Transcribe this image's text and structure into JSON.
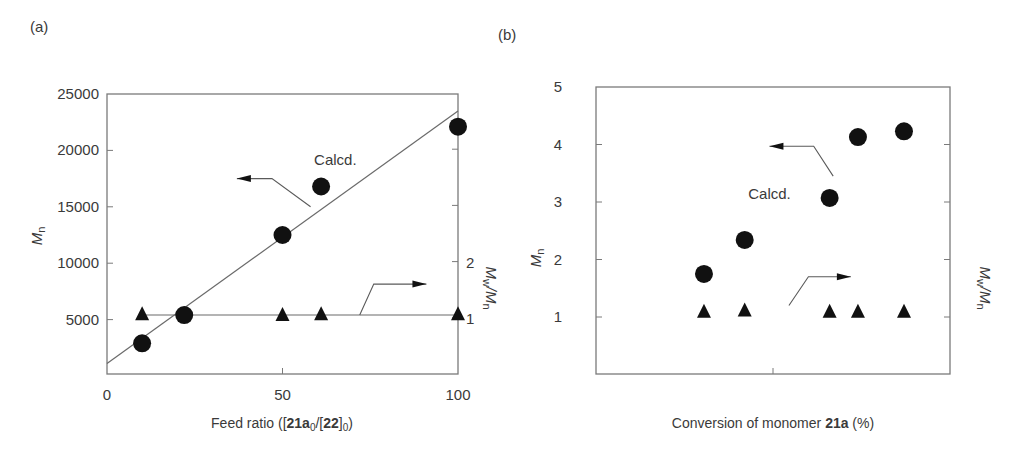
{
  "chart_data": [
    {
      "panel_label": "(a)",
      "type": "scatter",
      "title": "",
      "xlabel_parts": [
        {
          "text": "Feed ratio ([",
          "bold": false
        },
        {
          "text": "21a",
          "bold": true
        },
        {
          "text": "0",
          "bold": false,
          "sub": true
        },
        {
          "text": "/[",
          "bold": false
        },
        {
          "text": "22",
          "bold": true
        },
        {
          "text": "]",
          "bold": false
        },
        {
          "text": "0",
          "bold": false,
          "sub": true
        },
        {
          "text": ")",
          "bold": false
        }
      ],
      "ylabel_main": "M",
      "ylabel_sub": "n",
      "y2label": "Mw/Mn",
      "xlim": [
        0,
        100
      ],
      "ylim": [
        0,
        25000
      ],
      "y2lim": [
        0,
        5
      ],
      "x_ticks": [
        0,
        50,
        100
      ],
      "x_tick_labels": [
        "0",
        "50",
        "100"
      ],
      "y_ticks": [
        5000,
        10000,
        15000,
        20000,
        25000
      ],
      "y_tick_labels": [
        "5000",
        "10000",
        "15000",
        "20000",
        "25000"
      ],
      "y2_ticks": [
        1,
        2,
        3,
        4
      ],
      "y2_tick_labels": [
        "1",
        "2",
        "",
        ""
      ],
      "grid": false,
      "series": [
        {
          "name": "Mn (observed)",
          "axis": "left",
          "marker": "circle",
          "x": [
            10,
            22,
            50,
            61,
            100
          ],
          "y": [
            2900,
            5400,
            12500,
            16800,
            22100
          ]
        },
        {
          "name": "Mw/Mn",
          "axis": "right",
          "marker": "triangle",
          "x": [
            10,
            50,
            61,
            100
          ],
          "y": [
            1.07,
            1.06,
            1.07,
            1.07
          ]
        },
        {
          "name": "Calcd.",
          "axis": "left",
          "type": "line",
          "x": [
            0,
            100
          ],
          "y": [
            1100,
            23500
          ]
        },
        {
          "name": "Mw/Mn reference",
          "axis": "right",
          "type": "line",
          "x": [
            10,
            100
          ],
          "y": [
            1.05,
            1.05
          ]
        }
      ],
      "annotations": [
        {
          "text": "Calcd.",
          "x": 59,
          "y": 18700,
          "axis": "left"
        },
        {
          "type": "arrow",
          "direction": "left",
          "points_axis": "left",
          "path": [
            [
              58,
              15000
            ],
            [
              47,
              17500
            ],
            [
              37,
              17500
            ]
          ]
        },
        {
          "type": "arrow",
          "direction": "right",
          "points_axis": "right",
          "path": [
            [
              72,
              1.05
            ],
            [
              76,
              1.6
            ],
            [
              91,
              1.6
            ]
          ]
        }
      ]
    },
    {
      "panel_label": "(b)",
      "type": "scatter",
      "title": "",
      "xlabel_parts": [
        {
          "text": "Conversion of monomer ",
          "bold": false
        },
        {
          "text": "21a",
          "bold": true
        },
        {
          "text": " (%)",
          "bold": false
        }
      ],
      "ylabel_main": "M",
      "ylabel_sub": "n",
      "y2label": "Mw/Mn",
      "xlim": [
        0,
        100
      ],
      "ylim": [
        0,
        5
      ],
      "y2lim": [
        0,
        5
      ],
      "x_ticks": [
        50
      ],
      "x_tick_labels": [
        ""
      ],
      "y_ticks": [
        1,
        2,
        3,
        4,
        5
      ],
      "y_tick_labels": [
        "1",
        "2",
        "3",
        "4",
        "5"
      ],
      "y2_ticks": [
        1,
        2,
        3,
        4
      ],
      "y2_tick_labels": [
        "",
        "",
        "",
        ""
      ],
      "grid": false,
      "series": [
        {
          "name": "Mn (observed)",
          "axis": "left",
          "marker": "circle",
          "x": [
            30.5,
            42,
            66,
            74,
            87
          ],
          "y": [
            1.75,
            2.34,
            3.07,
            4.13,
            4.23
          ]
        },
        {
          "name": "Mw/Mn",
          "axis": "right",
          "marker": "triangle",
          "x": [
            30.5,
            42,
            66,
            74,
            87
          ],
          "y": [
            1.1,
            1.12,
            1.1,
            1.1,
            1.1
          ]
        }
      ],
      "annotations": [
        {
          "text": "Calcd.",
          "x": 43,
          "y": 3.05,
          "axis": "left"
        },
        {
          "type": "arrow",
          "direction": "left",
          "points_axis": "left",
          "path": [
            [
              67,
              3.45
            ],
            [
              61.5,
              3.97
            ],
            [
              49,
              3.97
            ]
          ]
        },
        {
          "type": "arrow",
          "direction": "right",
          "points_axis": "right",
          "path": [
            [
              54.5,
              1.2
            ],
            [
              60,
              1.7
            ],
            [
              72,
              1.7
            ]
          ]
        }
      ]
    }
  ]
}
